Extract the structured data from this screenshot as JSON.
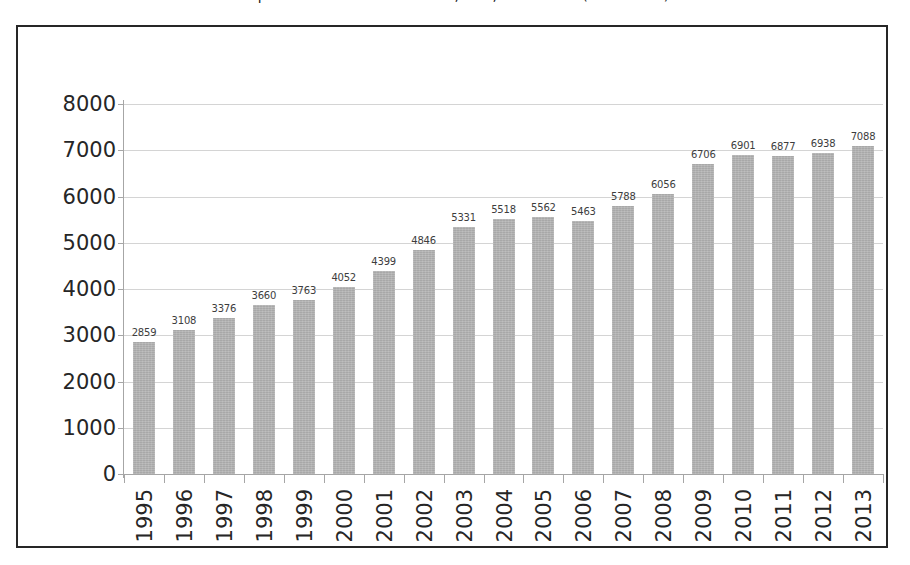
{
  "title": {
    "text": "Exports of Goods and Services, USA, 1995-2013 (billion USD)",
    "note": "clipped at top edge of screenshot"
  },
  "chart_data": {
    "type": "bar",
    "title": "",
    "xlabel": "",
    "ylabel": "",
    "ylim": [
      0,
      8000
    ],
    "ytick_step": 1000,
    "grid": true,
    "legend": "none",
    "bar_color": "#a8a8a8",
    "gridline_color": "#d4d4d4",
    "axis_color": "#a6a6a6",
    "frame_color": "#262626",
    "label_color": "#3d3d3d",
    "categories": [
      "1995",
      "1996",
      "1997",
      "1998",
      "1999",
      "2000",
      "2001",
      "2002",
      "2003",
      "2004",
      "2005",
      "2006",
      "2007",
      "2008",
      "2009",
      "2010",
      "2011",
      "2012",
      "2013"
    ],
    "values": [
      2859,
      3108,
      3376,
      3660,
      3763,
      4052,
      4399,
      4846,
      5331,
      5518,
      5562,
      5463,
      5788,
      6056,
      6706,
      6901,
      6877,
      6938,
      7088
    ],
    "ytick_labels": [
      "8000",
      "7000",
      "6000",
      "5000",
      "4000",
      "3000",
      "2000",
      "1000",
      "0"
    ],
    "ytick_values": [
      8000,
      7000,
      6000,
      5000,
      4000,
      3000,
      2000,
      1000,
      0
    ],
    "data_labels_shown": true,
    "x_label_rotation": 90
  }
}
